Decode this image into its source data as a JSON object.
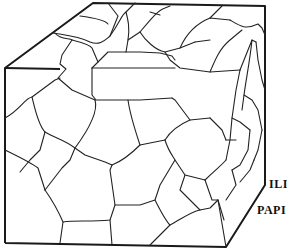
{
  "figure": {
    "labels": [
      "ILI",
      "PAPI"
    ],
    "colors": {
      "line": "#1a1a1a",
      "background": "#ffffff"
    }
  }
}
